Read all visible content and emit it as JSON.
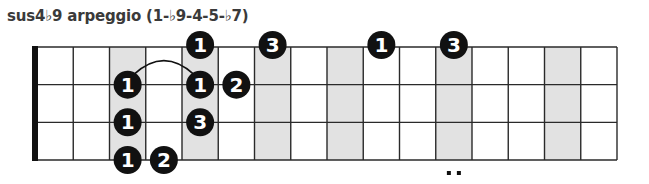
{
  "title": "sus4♭9 arpeggio (1-♭9-4-5-♭7)",
  "colors": {
    "line": "#2a2a2a",
    "shade": "#e2e2e2",
    "dot": "#111111",
    "dot_text": "#ffffff",
    "nut": "#111111"
  },
  "fretboard": {
    "strings": 4,
    "frets": 16,
    "shaded_frets": [
      3,
      5,
      7,
      9,
      12,
      15
    ],
    "double_dot_fret": 12
  },
  "notes": [
    {
      "string": 1,
      "fret": 5,
      "finger": "1"
    },
    {
      "string": 1,
      "fret": 7,
      "finger": "3"
    },
    {
      "string": 1,
      "fret": 10,
      "finger": "1"
    },
    {
      "string": 1,
      "fret": 12,
      "finger": "3"
    },
    {
      "string": 2,
      "fret": 3,
      "finger": "1"
    },
    {
      "string": 2,
      "fret": 5,
      "finger": "1"
    },
    {
      "string": 2,
      "fret": 6,
      "finger": "2"
    },
    {
      "string": 3,
      "fret": 3,
      "finger": "1"
    },
    {
      "string": 3,
      "fret": 5,
      "finger": "3"
    },
    {
      "string": 4,
      "fret": 3,
      "finger": "1"
    },
    {
      "string": 4,
      "fret": 4,
      "finger": "2"
    }
  ],
  "slurs": [
    {
      "string": 2,
      "from_fret": 3,
      "to_fret": 5
    }
  ]
}
